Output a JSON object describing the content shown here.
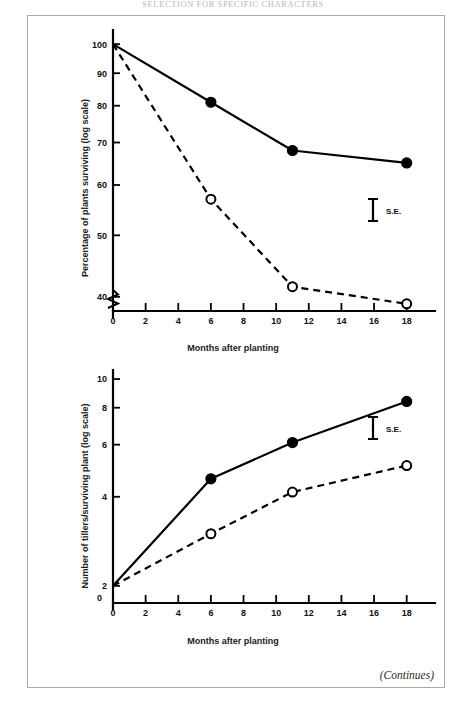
{
  "page": {
    "running_header": "SELECTION FOR SPECIFIC CHARACTERS",
    "continues_note": "(Continues)"
  },
  "chart_data": [
    {
      "id": "plants-surviving",
      "type": "line",
      "title": "",
      "xlabel": "Months after planting",
      "ylabel": "Percentage of plants surviving (log scale)",
      "yscale": "log",
      "ylim": [
        38,
        103
      ],
      "xlim": [
        0,
        19
      ],
      "xticks": [
        0,
        2,
        4,
        6,
        8,
        10,
        12,
        14,
        16,
        18
      ],
      "xticklabels": [
        "0",
        "2",
        "4",
        "6",
        "8",
        "10",
        "12",
        "14",
        "16",
        "18"
      ],
      "yticks": [
        40,
        50,
        60,
        70,
        80,
        90,
        100
      ],
      "yticklabels": [
        "40",
        "50",
        "60",
        "70",
        "80",
        "90",
        "100"
      ],
      "axis_break": true,
      "grid": false,
      "annotation": "S.E.",
      "series": [
        {
          "name": "solid-filled-circles",
          "style": "solid",
          "marker": "filled-circle",
          "x": [
            0,
            6,
            11,
            18
          ],
          "values": [
            100,
            81,
            68,
            65
          ]
        },
        {
          "name": "dashed-open-circles",
          "style": "dashed",
          "marker": "open-circle",
          "x": [
            0,
            6,
            11,
            18
          ],
          "values": [
            100,
            57,
            41.5,
            39
          ]
        }
      ]
    },
    {
      "id": "tillers-per-plant",
      "type": "line",
      "title": "",
      "xlabel": "Months after planting",
      "ylabel": "Number of tillers/surviving plant (log scale)",
      "yscale": "log",
      "ylim": [
        1.75,
        10.4
      ],
      "xlim": [
        0,
        19
      ],
      "xticks": [
        0,
        2,
        4,
        6,
        8,
        10,
        12,
        14,
        16,
        18
      ],
      "xticklabels": [
        "0",
        "2",
        "4",
        "6",
        "8",
        "10",
        "12",
        "14",
        "16",
        "18"
      ],
      "yticks": [
        2,
        4,
        6,
        8,
        10
      ],
      "yticklabels": [
        "2",
        "4",
        "6",
        "8",
        "10"
      ],
      "origin_label": "0",
      "axis_break": false,
      "grid": false,
      "annotation": "S.E.",
      "series": [
        {
          "name": "solid-filled-circles",
          "style": "solid",
          "marker": "filled-circle",
          "x": [
            0,
            6,
            11,
            18
          ],
          "values": [
            2.0,
            4.6,
            6.1,
            8.4
          ]
        },
        {
          "name": "dashed-open-circles",
          "style": "dashed",
          "marker": "open-circle",
          "x": [
            0,
            6,
            11,
            18
          ],
          "values": [
            2.0,
            3.0,
            4.15,
            5.1
          ]
        }
      ]
    }
  ]
}
